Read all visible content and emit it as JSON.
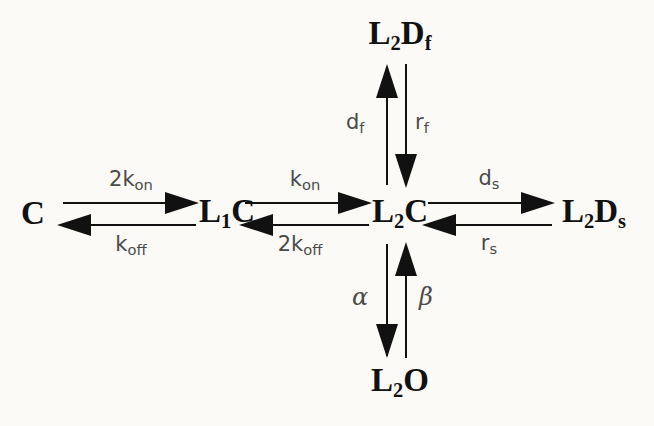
{
  "diagram": {
    "type": "state-transition-diagram",
    "background_color": "#fbfaf7",
    "ink_color": "#111111",
    "label_color": "#4a4a4a",
    "nodes": [
      {
        "id": "C",
        "label_html": "C",
        "plain": "C",
        "x": 33,
        "y": 213
      },
      {
        "id": "L1C",
        "label_html": "L<sub>1</sub>C",
        "plain": "L1C",
        "x": 227,
        "y": 213
      },
      {
        "id": "L2C",
        "label_html": "L<sub>2</sub>C",
        "plain": "L2C",
        "x": 400,
        "y": 213
      },
      {
        "id": "L2Ds",
        "label_html": "L<sub>2</sub>D<sub>s</sub>",
        "plain": "L2Ds",
        "x": 594,
        "y": 213
      },
      {
        "id": "L2Df",
        "label_html": "L<sub>2</sub>D<sub>f</sub>",
        "plain": "L2Df",
        "x": 400,
        "y": 35
      },
      {
        "id": "L2O",
        "label_html": "L<sub>2</sub>O",
        "plain": "L2O",
        "x": 400,
        "y": 382
      }
    ],
    "rates": [
      {
        "id": "2kon",
        "label_html": "2k<sub>on</sub>",
        "plain": "2kon",
        "from": "C",
        "to": "L1C",
        "x": 131,
        "y": 181,
        "align": "center"
      },
      {
        "id": "koff",
        "label_html": "k<sub>off</sub>",
        "plain": "koff",
        "from": "L1C",
        "to": "C",
        "x": 131,
        "y": 246,
        "align": "center"
      },
      {
        "id": "kon",
        "label_html": "k<sub>on</sub>",
        "plain": "kon",
        "from": "L1C",
        "to": "L2C",
        "x": 305,
        "y": 181,
        "align": "center"
      },
      {
        "id": "2koff",
        "label_html": "2k<sub>off</sub>",
        "plain": "2koff",
        "from": "L2C",
        "to": "L1C",
        "x": 300,
        "y": 246,
        "align": "center"
      },
      {
        "id": "ds",
        "label_html": "d<sub>s</sub>",
        "plain": "ds",
        "from": "L2C",
        "to": "L2Ds",
        "x": 489,
        "y": 180,
        "align": "center"
      },
      {
        "id": "rs",
        "label_html": "r<sub>s</sub>",
        "plain": "rs",
        "from": "L2Ds",
        "to": "L2C",
        "x": 489,
        "y": 245,
        "align": "center"
      },
      {
        "id": "df",
        "label_html": "d<sub>f</sub>",
        "plain": "df",
        "from": "L2C",
        "to": "L2Df",
        "x": 359,
        "y": 124,
        "align": "right"
      },
      {
        "id": "rf",
        "label_html": "r<sub>f</sub>",
        "plain": "rf",
        "from": "L2Df",
        "to": "L2C",
        "x": 411,
        "y": 124,
        "align": "left"
      }
    ],
    "greek_rates": [
      {
        "id": "alpha",
        "label": "α",
        "plain": "alpha",
        "from": "L2O",
        "to": "L2C",
        "x": 362,
        "y": 297,
        "align": "right"
      },
      {
        "id": "beta",
        "label": "β",
        "plain": "beta",
        "from": "L2C",
        "to": "L2O",
        "x": 412,
        "y": 297,
        "align": "left"
      }
    ],
    "edges": [
      {
        "id": "C-L1C",
        "orientation": "horizontal",
        "forward": "2kon",
        "reverse": "koff"
      },
      {
        "id": "L1C-L2C",
        "orientation": "horizontal",
        "forward": "kon",
        "reverse": "2koff"
      },
      {
        "id": "L2C-L2Ds",
        "orientation": "horizontal",
        "forward": "ds",
        "reverse": "rs"
      },
      {
        "id": "L2C-L2Df",
        "orientation": "vertical",
        "forward": "df",
        "reverse": "rf"
      },
      {
        "id": "L2C-L2O",
        "orientation": "vertical",
        "forward": "beta",
        "reverse": "alpha"
      }
    ]
  }
}
